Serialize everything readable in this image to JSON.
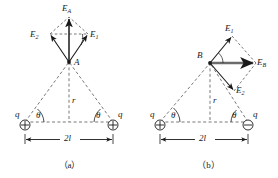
{
  "figure": {
    "type": "physics-vector-diagram",
    "panels": [
      {
        "id": "a",
        "caption": "（a）",
        "point_label": "A",
        "charge_left": {
          "symbol": "⊕",
          "label": "q",
          "polarity": "positive"
        },
        "charge_right": {
          "symbol": "⊕",
          "label": "q",
          "polarity": "positive"
        },
        "angle_left_label": "θ",
        "angle_right_label": "θ",
        "distance_label": "r",
        "separation_label": "2l",
        "vectors": [
          {
            "name": "E1",
            "base": "E",
            "sub": "1",
            "direction": "up-right"
          },
          {
            "name": "E2",
            "base": "E",
            "sub": "2",
            "direction": "up-left"
          },
          {
            "name": "EA",
            "base": "E",
            "sub": "A",
            "direction": "up",
            "resultant": true
          }
        ]
      },
      {
        "id": "b",
        "caption": "（b）",
        "point_label": "B",
        "charge_left": {
          "symbol": "⊕",
          "label": "q",
          "polarity": "positive"
        },
        "charge_right": {
          "symbol": "⊖",
          "label": "q",
          "polarity": "negative"
        },
        "angle_left_label": "θ",
        "angle_right_label": "θ",
        "distance_label": "r",
        "separation_label": "2l",
        "vectors": [
          {
            "name": "E1",
            "base": "E",
            "sub": "1",
            "direction": "up-right"
          },
          {
            "name": "E2",
            "base": "E",
            "sub": "2",
            "direction": "down-right"
          },
          {
            "name": "EB",
            "base": "E",
            "sub": "B",
            "direction": "right",
            "resultant": true
          }
        ]
      }
    ]
  },
  "colors": {
    "stroke": "#1a1a1a",
    "dashed": "#555555",
    "resultant": "#6b6b6b",
    "text": "#1a1a1a",
    "background": "#ffffff"
  }
}
